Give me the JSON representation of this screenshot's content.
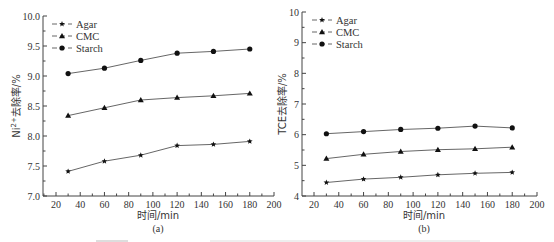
{
  "chart_data": [
    {
      "type": "line",
      "panel_label": "(a)",
      "title": "",
      "xlabel": "时间/min",
      "ylabel": "Ni²⁺去除率/%",
      "xlim": [
        10,
        200
      ],
      "ylim": [
        7.0,
        10.0
      ],
      "x_ticks": [
        20,
        40,
        60,
        80,
        100,
        120,
        140,
        160,
        180,
        200
      ],
      "y_ticks": [
        "7.0",
        "7.5",
        "8.0",
        "8.5",
        "9.0",
        "9.5",
        "10.0"
      ],
      "grid": false,
      "legend_position": "upper left",
      "x": [
        30,
        60,
        90,
        120,
        150,
        180
      ],
      "series": [
        {
          "name": "Agar",
          "marker": "star",
          "values": [
            7.41,
            7.58,
            7.68,
            7.84,
            7.86,
            7.91
          ]
        },
        {
          "name": "CMC",
          "marker": "triangle",
          "values": [
            8.34,
            8.47,
            8.6,
            8.64,
            8.67,
            8.71
          ]
        },
        {
          "name": "Starch",
          "marker": "circle",
          "values": [
            9.04,
            9.13,
            9.26,
            9.38,
            9.41,
            9.45
          ]
        }
      ]
    },
    {
      "type": "line",
      "panel_label": "(b)",
      "title": "",
      "xlabel": "时间/min",
      "ylabel": "TCE去除率/%",
      "xlim": [
        10,
        200
      ],
      "ylim": [
        4,
        10
      ],
      "x_ticks": [
        20,
        40,
        60,
        80,
        100,
        120,
        140,
        160,
        180,
        200
      ],
      "y_ticks": [
        "4",
        "5",
        "6",
        "7",
        "8",
        "9",
        "10"
      ],
      "grid": false,
      "legend_position": "upper left",
      "x": [
        30,
        60,
        90,
        120,
        150,
        180
      ],
      "series": [
        {
          "name": "Agar",
          "marker": "star",
          "values": [
            4.44,
            4.55,
            4.61,
            4.69,
            4.74,
            4.77
          ]
        },
        {
          "name": "CMC",
          "marker": "triangle",
          "values": [
            5.22,
            5.36,
            5.45,
            5.51,
            5.54,
            5.59
          ]
        },
        {
          "name": "Starch",
          "marker": "circle",
          "values": [
            6.03,
            6.1,
            6.17,
            6.21,
            6.28,
            6.22
          ]
        }
      ]
    }
  ],
  "panels": [
    {
      "ylabel_main": "Ni",
      "ylabel_sup": "2+",
      "ylabel_rest": "去除率/%",
      "xlabel": "时间/min",
      "panel_label": "(a)"
    },
    {
      "ylabel_main": "TCE",
      "ylabel_sup": "",
      "ylabel_rest": "去除率/%",
      "xlabel": "时间/min",
      "panel_label": "(b)"
    }
  ]
}
